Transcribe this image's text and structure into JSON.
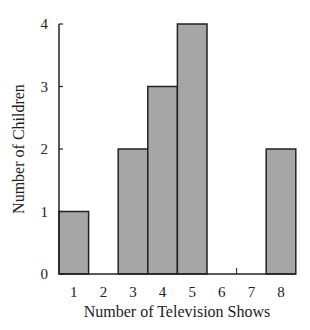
{
  "chart_data": {
    "type": "bar",
    "title": "",
    "xlabel": "Number of Television Shows",
    "ylabel": "Number of Children",
    "categories": [
      "1",
      "2",
      "3",
      "4",
      "5",
      "6",
      "7",
      "8"
    ],
    "values": [
      1,
      0,
      2,
      3,
      4,
      0,
      0,
      2
    ],
    "ylim": [
      0,
      4
    ],
    "yticks": [
      "0",
      "1",
      "2",
      "3",
      "4"
    ],
    "grid": false,
    "legend": null,
    "bar_color": "#a6a6a6",
    "edge_color": "#222222"
  }
}
